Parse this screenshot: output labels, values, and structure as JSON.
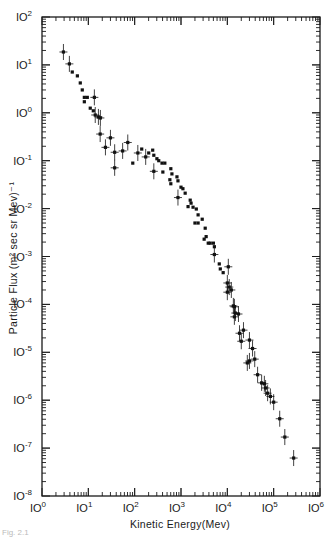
{
  "caption_fragment": "Fig. 2.1",
  "chart_data": {
    "type": "scatter",
    "title": "",
    "xlabel": "Kinetic Energy(Mev)",
    "ylabel": "Particle Flux (m² sec sr Mev)⁻¹",
    "xscale": "log",
    "yscale": "log",
    "xlim": [
      1,
      1000000
    ],
    "ylim": [
      1e-08,
      100
    ],
    "grid": false,
    "legend": null,
    "x_ticks": [
      "10^0",
      "10^1",
      "10^2",
      "10^3",
      "10^4",
      "10^5",
      "10^6"
    ],
    "y_ticks": [
      "10^2",
      "10^1",
      "10^0",
      "10^-1",
      "10^-2",
      "10^-3",
      "10^-4",
      "10^-5",
      "10^-6",
      "10^-7",
      "10^-8"
    ],
    "series": [
      {
        "name": "flux",
        "color": "#111111",
        "points": [
          [
            2.9,
            18.6,
            1
          ],
          [
            3.9,
            10.5,
            1
          ],
          [
            4.5,
            7.1,
            0
          ],
          [
            5.8,
            5.9,
            0
          ],
          [
            6.7,
            4.2,
            0
          ],
          [
            7.4,
            3.0,
            0
          ],
          [
            8.2,
            2.1,
            0
          ],
          [
            9.5,
            2.1,
            0
          ],
          [
            8.2,
            1.7,
            0
          ],
          [
            13.5,
            2.1,
            1
          ],
          [
            11,
            1.25,
            0
          ],
          [
            12.8,
            1.1,
            0
          ],
          [
            14.1,
            0.9,
            1
          ],
          [
            16.5,
            0.82,
            1
          ],
          [
            18.2,
            0.78,
            1
          ],
          [
            18,
            0.36,
            1
          ],
          [
            23.4,
            0.19,
            1
          ],
          [
            30,
            0.3,
            1
          ],
          [
            37,
            0.15,
            1
          ],
          [
            37,
            0.071,
            1
          ],
          [
            55,
            0.16,
            1
          ],
          [
            71,
            0.24,
            1
          ],
          [
            91,
            0.089,
            0
          ],
          [
            117,
            0.145,
            1
          ],
          [
            142,
            0.175,
            0
          ],
          [
            173,
            0.12,
            1
          ],
          [
            201,
            0.145,
            0
          ],
          [
            245,
            0.166,
            0
          ],
          [
            259,
            0.13,
            0
          ],
          [
            259,
            0.06,
            1
          ],
          [
            302,
            0.11,
            0
          ],
          [
            331,
            0.1,
            0
          ],
          [
            389,
            0.089,
            0
          ],
          [
            448,
            0.089,
            0
          ],
          [
            406,
            0.058,
            0
          ],
          [
            603,
            0.068,
            0
          ],
          [
            637,
            0.053,
            0
          ],
          [
            575,
            0.04,
            0
          ],
          [
            603,
            0.033,
            0
          ],
          [
            818,
            0.046,
            0
          ],
          [
            860,
            0.038,
            0
          ],
          [
            1000,
            0.028,
            0
          ],
          [
            1100,
            0.026,
            0
          ],
          [
            1230,
            0.021,
            0
          ],
          [
            860,
            0.017,
            1
          ],
          [
            1580,
            0.015,
            0
          ],
          [
            1650,
            0.013,
            0
          ],
          [
            1420,
            0.011,
            0
          ],
          [
            1820,
            0.0107,
            0
          ],
          [
            2140,
            0.0098,
            0
          ],
          [
            2340,
            0.0074,
            0
          ],
          [
            2000,
            0.005,
            0
          ],
          [
            2340,
            0.005,
            0
          ],
          [
            2870,
            0.006,
            0
          ],
          [
            3330,
            0.0039,
            0
          ],
          [
            3490,
            0.0026,
            0
          ],
          [
            3160,
            0.0023,
            0
          ],
          [
            3870,
            0.0019,
            0
          ],
          [
            4270,
            0.0019,
            0
          ],
          [
            5000,
            0.0019,
            0
          ],
          [
            5250,
            0.0016,
            0
          ],
          [
            5250,
            0.0011,
            1
          ],
          [
            6700,
            0.0007,
            0
          ],
          [
            7050,
            0.00055,
            0
          ],
          [
            8130,
            0.00046,
            0
          ],
          [
            10500,
            0.00061,
            1
          ],
          [
            10000,
            0.00028,
            1
          ],
          [
            11000,
            0.00023,
            1
          ],
          [
            12200,
            0.0002,
            1
          ],
          [
            10000,
            0.00018,
            1
          ],
          [
            13500,
            9.3e-05,
            1
          ],
          [
            14200,
            8.9e-05,
            1
          ],
          [
            14900,
            6.6e-05,
            1
          ],
          [
            17400,
            6.3e-05,
            1
          ],
          [
            14200,
            5.5e-05,
            1
          ],
          [
            18300,
            2.5e-05,
            1
          ],
          [
            22300,
            2.9e-05,
            1
          ],
          [
            20000,
            1.7e-05,
            1
          ],
          [
            30000,
            1.8e-05,
            1
          ],
          [
            35000,
            1.2e-05,
            1
          ],
          [
            39000,
            7.2e-06,
            1
          ],
          [
            30000,
            6.6e-06,
            1
          ],
          [
            27000,
            6e-06,
            1
          ],
          [
            45000,
            3.4e-06,
            1
          ],
          [
            55000,
            2.3e-06,
            1
          ],
          [
            63000,
            2.2e-06,
            1
          ],
          [
            67000,
            1.8e-06,
            1
          ],
          [
            74000,
            1.4e-06,
            1
          ],
          [
            85000,
            1.2e-06,
            1
          ],
          [
            100000,
            9.1e-07,
            1
          ],
          [
            135000,
            4.1e-07,
            1
          ],
          [
            174000,
            1.7e-07,
            1
          ],
          [
            270000,
            6.2e-08,
            1
          ]
        ]
      }
    ]
  }
}
